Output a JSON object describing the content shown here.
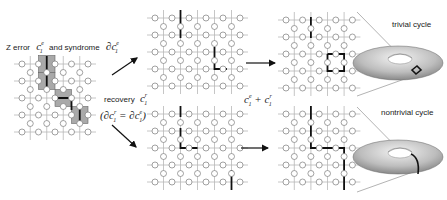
{
  "labels": {
    "z_error": "Z error",
    "and_syndrome": "and syndrome",
    "error_chain": "c",
    "error_chain_sup": "e",
    "error_chain_sub": "1",
    "syndrome": "∂c",
    "recovery": "recovery",
    "recovery_chain": "c",
    "recovery_sup": "r",
    "recovery_sub": "1",
    "boundary_eq": "(∂c",
    "boundary_eq_mid": " = ∂c",
    "boundary_eq_end": ")",
    "sum": "c",
    "sum_plus": " + c",
    "trivial_cycle": "trivial cycle",
    "nontrivial_cycle": "nontrivial cycle"
  },
  "colors": {
    "grid": "#b8b8b8",
    "circle_stroke": "#7a7a7a",
    "chain": "#111111",
    "plaquette_fill": "#a9a9a9",
    "plaquette_stroke": "#666666",
    "torus_light": "#e6e6e6",
    "torus_dark": "#8a8a8a"
  },
  "grids": [
    {
      "name": "error-syndrome-lattice",
      "x0": 22,
      "y0": 64,
      "dx": 16.5,
      "dy": 17,
      "cols": 5,
      "rows": 5
    },
    {
      "name": "syndrome-lattice",
      "x0": 155,
      "y0": 18,
      "dx": 17,
      "dy": 17,
      "cols": 6,
      "rows": 5
    },
    {
      "name": "recovery-lattice",
      "x0": 155,
      "y0": 114,
      "dx": 17,
      "dy": 17,
      "cols": 6,
      "rows": 5
    },
    {
      "name": "trivial-sum-lattice",
      "x0": 286,
      "y0": 20,
      "dx": 16.6,
      "dy": 17,
      "cols": 5,
      "rows": 5
    },
    {
      "name": "nontrivial-sum-lattice",
      "x0": 286,
      "y0": 114,
      "dx": 16.6,
      "dy": 17,
      "cols": 5,
      "rows": 5
    }
  ]
}
